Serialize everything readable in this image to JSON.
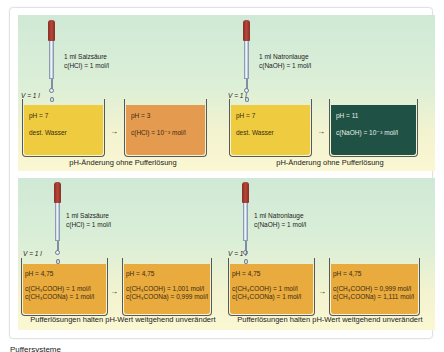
{
  "diagram": {
    "type": "chemistry-buffer-illustration",
    "panels": [
      {
        "id": "hcl-water",
        "reagent": {
          "line1": "1 ml Salzsäure",
          "line2": "c(HCl) = 1 mol/l"
        },
        "volume_label": "V = 1 l",
        "before": {
          "ph": "pH = 7",
          "line1": "dest. Wasser",
          "line2": "",
          "color": "#efcb3f"
        },
        "after": {
          "ph": "pH = 3",
          "line1": "c(HCl) = 10⁻³ mol/l",
          "line2": "",
          "color": "#e49a4f"
        },
        "caption": "pH-Änderung ohne Pufferlösung"
      },
      {
        "id": "naoh-water",
        "reagent": {
          "line1": "1 ml Natronlauge",
          "line2": "c(NaOH) = 1 mol/l"
        },
        "volume_label": "V = 1 l",
        "before": {
          "ph": "pH = 7",
          "line1": "dest. Wasser",
          "line2": "",
          "color": "#efcb3f"
        },
        "after": {
          "ph": "pH = 11",
          "line1": "c(NaOH) = 10⁻³ mol/l",
          "line2": "",
          "color": "#1f5144"
        },
        "caption": "pH-Änderung ohne Pufferlösung"
      },
      {
        "id": "hcl-buffer",
        "reagent": {
          "line1": "1 ml Salzsäure",
          "line2": "c(HCl) = 1 mol/l"
        },
        "volume_label": "V = 1 l",
        "before": {
          "ph": "pH = 4,75",
          "line1": "c(CH₃COOH) = 1 mol/l",
          "line2": "c(CH₃COONa) = 1 mol/l",
          "color": "#e9aa3e"
        },
        "after": {
          "ph": "pH = 4,75",
          "line1": "c(CH₃COOH) = 1,001 mol/l",
          "line2": "c(CH₃COONa) = 0,999 mol/l",
          "color": "#e9aa3e"
        },
        "caption": "Pufferlösungen halten pH-Wert weitgehend unverändert"
      },
      {
        "id": "naoh-buffer",
        "reagent": {
          "line1": "1 ml Natronlauge",
          "line2": "c(NaOH) = 1 mol/l"
        },
        "volume_label": "V = 1 l",
        "before": {
          "ph": "pH = 4,75",
          "line1": "c(CH₃COOH) = 1 mol/l",
          "line2": "c(CH₃COONa) = 1 mol/l",
          "color": "#e9aa3e"
        },
        "after": {
          "ph": "pH = 4,75",
          "line1": "c(CH₃COOH) = 0,999 mol/l",
          "line2": "c(CH₃COONa) = 1,111 mol/l",
          "color": "#e9aa3e"
        },
        "caption": "Pufferlösungen halten pH-Wert weitgehend unverändert"
      }
    ],
    "arrow": "→",
    "footer": "Puffersysteme"
  }
}
